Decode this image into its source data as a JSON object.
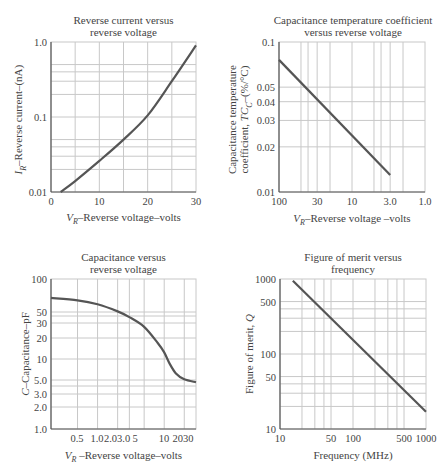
{
  "chart_data": [
    {
      "id": "reverse-current",
      "type": "line",
      "title": [
        "Reverse current versus",
        "reverse voltage"
      ],
      "xlabel": "VR–Reverse voltage–volts",
      "xlabel_main": "V",
      "xlabel_sub": "R",
      "xlabel_rest": "–Reverse voltage–volts",
      "ylabel": "IR–Reverse current–(nA)",
      "ylabel_main": "I",
      "ylabel_sub": "R",
      "ylabel_rest": "–Reverse current–(nA)",
      "xscale": "linear",
      "yscale": "log",
      "xlim": [
        0,
        30
      ],
      "ylim": [
        0.01,
        1.0
      ],
      "xticks": [
        0,
        10,
        20,
        30
      ],
      "xtick_labels": [
        "0",
        "10",
        "20",
        "30"
      ],
      "xgrid": [
        5,
        10,
        15,
        20,
        25
      ],
      "yticks": [
        0.01,
        0.1,
        1.0
      ],
      "ytick_labels": [
        "0.01",
        "0.1",
        "1.0"
      ],
      "ygrid": [
        0.02,
        0.03,
        0.04,
        0.05,
        0.1,
        0.2,
        0.3,
        0.4,
        0.5
      ],
      "grid": true,
      "series": [
        {
          "name": "IR",
          "x": [
            2,
            5,
            10,
            15,
            20,
            25,
            30
          ],
          "y": [
            0.01,
            0.014,
            0.026,
            0.05,
            0.105,
            0.3,
            0.9
          ]
        }
      ],
      "box": {
        "left": 51,
        "top": 42,
        "width": 145,
        "height": 150
      }
    },
    {
      "id": "temp-coefficient",
      "type": "line",
      "title": [
        "Capacitance temperature coefficient",
        "versus reverse voltage"
      ],
      "xlabel": "VR–Reverse voltage –volts",
      "xlabel_main": "V",
      "xlabel_sub": "R",
      "xlabel_rest": "–Reverse voltage –volts",
      "ylabel": [
        "Capacitance temperature",
        "coefficient, TCC–(%/°C)"
      ],
      "ylabel_line1": "Capacitance temperature",
      "ylabel_line2_pre": "coefficient, ",
      "ylabel_main": "TC",
      "ylabel_sub": "C",
      "ylabel_rest": "–(%/°C)",
      "xscale": "log",
      "x_reversed": true,
      "yscale": "log",
      "xlim": [
        100,
        1.0
      ],
      "ylim": [
        0.01,
        0.1
      ],
      "xticks": [
        100,
        30,
        10,
        3.0,
        1.0
      ],
      "xtick_labels": [
        "100",
        "30",
        "10",
        "3.0",
        "1.0"
      ],
      "xgrid": [
        50,
        40,
        30,
        20,
        10,
        5,
        4,
        3,
        2
      ],
      "yticks": [
        0.01,
        0.02,
        0.03,
        0.04,
        0.05,
        0.1
      ],
      "ytick_labels": [
        "0.01",
        "0.02",
        "0.03",
        "0.04",
        "0.05",
        "0.1"
      ],
      "ygrid": [
        0.02,
        0.03,
        0.04,
        0.05
      ],
      "grid": true,
      "series": [
        {
          "name": "TCC",
          "x": [
            100,
            3.0
          ],
          "y": [
            0.076,
            0.013
          ]
        }
      ],
      "box": {
        "left": 279,
        "top": 42,
        "width": 146,
        "height": 150
      }
    },
    {
      "id": "capacitance",
      "type": "line",
      "title": [
        "Capacitance versus",
        "reverse voltage"
      ],
      "xlabel": "VR –Reverse voltage–volts",
      "xlabel_main": "V",
      "xlabel_sub": "R",
      "xlabel_rest": " –Reverse voltage–volts",
      "ylabel": "C–Capacitance–pF",
      "ylabel_main": "C",
      "ylabel_sub": "",
      "ylabel_rest": "–Capacitance–pF",
      "xscale": "log",
      "yscale": "log",
      "xlim": [
        0.2,
        30
      ],
      "ylim": [
        1.0,
        100
      ],
      "xticks": [
        0.5,
        1.0,
        2.0,
        3.0,
        5,
        10,
        20,
        30
      ],
      "xtick_labels": [
        "0.5",
        "1.0",
        "2.0",
        "3.0",
        "5",
        "10",
        "20",
        "30"
      ],
      "xtick_label_positions": [
        77,
        97,
        117,
        126,
        135,
        164,
        183,
        194
      ],
      "xtick_label_text": [
        "0.5",
        "1.0",
        "2.03.0",
        "",
        "5",
        "10",
        "2030",
        ""
      ],
      "xgrid": [
        0.5,
        1.0,
        2.0,
        3.0,
        5,
        10,
        20
      ],
      "yticks": [
        1.0,
        2.0,
        3.0,
        5.0,
        10,
        20,
        30,
        50,
        100
      ],
      "ytick_labels": [
        "1.0",
        "2.0",
        "3.0",
        "5.0",
        "10",
        "20",
        "30",
        "50",
        "100"
      ],
      "ytick_pixel": [
        429,
        407,
        394,
        380,
        359,
        338,
        323,
        312,
        279
      ],
      "ygrid_pixel": [
        312,
        316,
        323,
        338,
        359,
        380,
        386,
        394,
        407
      ],
      "grid": true,
      "series": [
        {
          "name": "C",
          "x": [
            0.2,
            0.5,
            1.0,
            2.0,
            3.0,
            5,
            8,
            10,
            12,
            15,
            20,
            30
          ],
          "y": [
            56,
            52,
            46,
            37,
            31,
            23,
            14,
            10.5,
            7.5,
            5.5,
            4.6,
            4.2
          ]
        }
      ],
      "box": {
        "left": 51,
        "top": 279,
        "width": 145,
        "height": 150
      }
    },
    {
      "id": "figure-of-merit",
      "type": "line",
      "title": [
        "Figure of merit versus",
        "frequency"
      ],
      "xlabel": "Frequency (MHz)",
      "ylabel": "Figure of merit, Q",
      "ylabel_main": "Figure of merit, ",
      "ylabel_q": "Q",
      "xscale": "log",
      "yscale": "log",
      "xlim": [
        10,
        1000
      ],
      "ylim": [
        10,
        1000
      ],
      "xticks": [
        10,
        50,
        100,
        500,
        1000
      ],
      "xtick_labels": [
        "10",
        "50",
        "100",
        "500",
        "1000"
      ],
      "xgrid": [
        20,
        30,
        40,
        50,
        100,
        200,
        300,
        400,
        500
      ],
      "yticks": [
        10,
        50,
        100,
        500,
        1000
      ],
      "ytick_labels": [
        "10",
        "50",
        "100",
        "500",
        "1000"
      ],
      "ygrid": [
        20,
        30,
        40,
        50,
        100,
        200,
        300,
        400,
        500
      ],
      "grid": true,
      "series": [
        {
          "name": "Q",
          "x": [
            15,
            1000
          ],
          "y": [
            950,
            17
          ]
        }
      ],
      "box": {
        "left": 280,
        "top": 279,
        "width": 146,
        "height": 150
      }
    }
  ],
  "style": {
    "line_color": "#555555",
    "grid_color": "#c8c8c8",
    "axis_color": "#555555",
    "text_color": "#444444"
  }
}
